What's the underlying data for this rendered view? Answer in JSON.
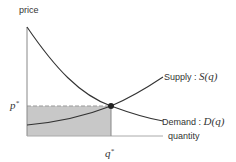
{
  "diagram": {
    "type": "supply-demand",
    "axes": {
      "y_label": "price",
      "x_label": "quantity"
    },
    "curves": [
      {
        "name": "supply",
        "label_prefix": "Supply :",
        "label_math": "S(q)"
      },
      {
        "name": "demand",
        "label_prefix": "Demand :",
        "label_math": "D(q)"
      }
    ],
    "equilibrium": {
      "price_label": "p*",
      "quantity_label": "q*"
    },
    "colors": {
      "curve": "#333333",
      "shade": "#c8c8c8",
      "axis": "#888888",
      "dashed": "#999999"
    }
  }
}
